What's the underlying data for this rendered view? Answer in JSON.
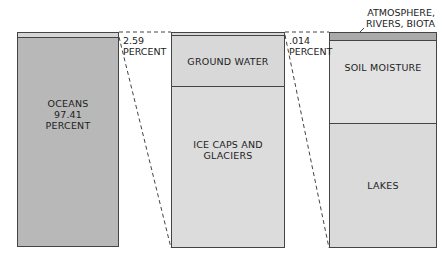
{
  "columns": [
    {
      "name": "total-water",
      "segments": [
        {
          "label": "",
          "color": "#d6d6d6"
        },
        {
          "label": "OCEANS\n97.41\nPERCENT",
          "color": "#b8b8b8"
        }
      ]
    },
    {
      "name": "fresh-water",
      "segments": [
        {
          "label": "",
          "color": "#d8d8d8"
        },
        {
          "label": "GROUND WATER",
          "color": "#d8d8d8"
        },
        {
          "label": "ICE CAPS AND\nGLACIERS",
          "color": "#dcdcdc"
        }
      ]
    },
    {
      "name": "liquid-fresh-water",
      "segments": [
        {
          "label": "",
          "color": "#aaaaaa"
        },
        {
          "label": "SOIL MOISTURE",
          "color": "#e2e2e2"
        },
        {
          "label": "LAKES",
          "color": "#dadada"
        }
      ]
    }
  ],
  "callouts": {
    "fresh_pct": "2.59\nPERCENT",
    "liquid_pct": ".014\nPERCENT",
    "atmosphere": "ATMOSPHERE,\nRIVERS, BIOTA"
  }
}
